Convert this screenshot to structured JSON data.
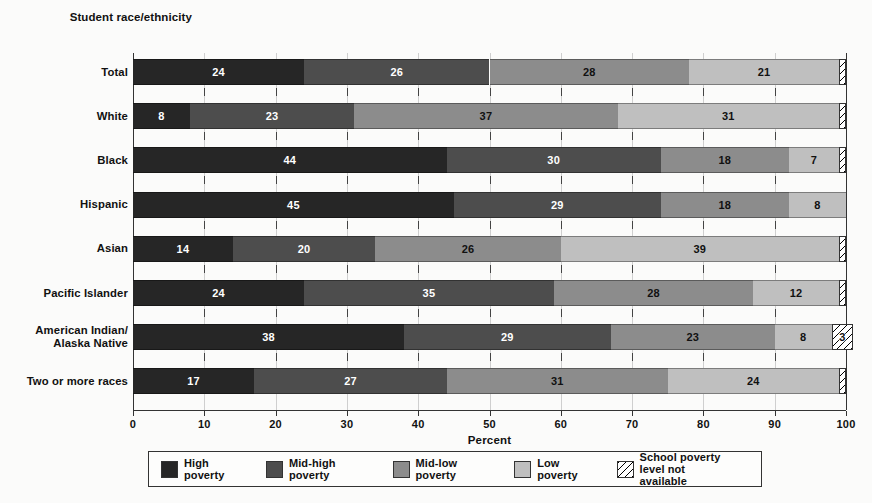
{
  "axis_titles": {
    "y": "Student\nrace/ethnicity",
    "x": "Percent"
  },
  "legend": {
    "items": [
      {
        "key": "high",
        "label": "High poverty",
        "color": "#262626",
        "pattern": "solid"
      },
      {
        "key": "mid_high",
        "label": "Mid-high poverty",
        "color": "#4d4d4d",
        "pattern": "solid"
      },
      {
        "key": "mid_low",
        "label": "Mid-low poverty",
        "color": "#8c8c8c",
        "pattern": "solid"
      },
      {
        "key": "low",
        "label": "Low poverty",
        "color": "#bfbfbf",
        "pattern": "solid"
      },
      {
        "key": "na",
        "label": "School poverty\nlevel not available",
        "color": "#ffffff",
        "pattern": "diagonal-hatch"
      }
    ]
  },
  "chart_data": {
    "type": "bar",
    "orientation": "horizontal",
    "stacked": true,
    "title": "",
    "subtitle": "",
    "xlabel": "Percent",
    "ylabel": "Student race/ethnicity",
    "xlim": [
      0,
      100
    ],
    "xticks": [
      0,
      10,
      20,
      30,
      40,
      50,
      60,
      70,
      80,
      90,
      100
    ],
    "xtick_labels": [
      "0",
      "10",
      "20",
      "30",
      "40",
      "50",
      "60",
      "70",
      "80",
      "90",
      "100"
    ],
    "grid": true,
    "legend_position": "bottom",
    "categories": [
      "Total",
      "White",
      "Black",
      "Hispanic",
      "Asian",
      "Pacific Islander",
      "American Indian/\nAlaska Native",
      "Two or more races"
    ],
    "series": [
      {
        "name": "High poverty",
        "color": "#262626",
        "values": [
          24,
          8,
          44,
          45,
          14,
          24,
          38,
          17
        ]
      },
      {
        "name": "Mid-high poverty",
        "color": "#4d4d4d",
        "values": [
          26,
          23,
          30,
          29,
          20,
          35,
          29,
          27
        ]
      },
      {
        "name": "Mid-low poverty",
        "color": "#8c8c8c",
        "values": [
          28,
          37,
          18,
          18,
          26,
          28,
          23,
          31
        ]
      },
      {
        "name": "Low poverty",
        "color": "#bfbfbf",
        "values": [
          21,
          31,
          7,
          8,
          39,
          12,
          8,
          24
        ]
      },
      {
        "name": "School poverty level not available",
        "color": "#ffffff",
        "values": [
          1,
          1,
          1,
          0,
          1,
          1,
          3,
          1
        ]
      }
    ],
    "value_labels": [
      [
        "24",
        "26",
        "28",
        "21",
        ""
      ],
      [
        "8",
        "23",
        "37",
        "31",
        ""
      ],
      [
        "44",
        "30",
        "18",
        "7",
        ""
      ],
      [
        "45",
        "29",
        "18",
        "8",
        ""
      ],
      [
        "14",
        "20",
        "26",
        "39",
        ""
      ],
      [
        "24",
        "35",
        "28",
        "12",
        ""
      ],
      [
        "38",
        "29",
        "23",
        "8",
        "3"
      ],
      [
        "17",
        "27",
        "31",
        "24",
        ""
      ]
    ]
  }
}
